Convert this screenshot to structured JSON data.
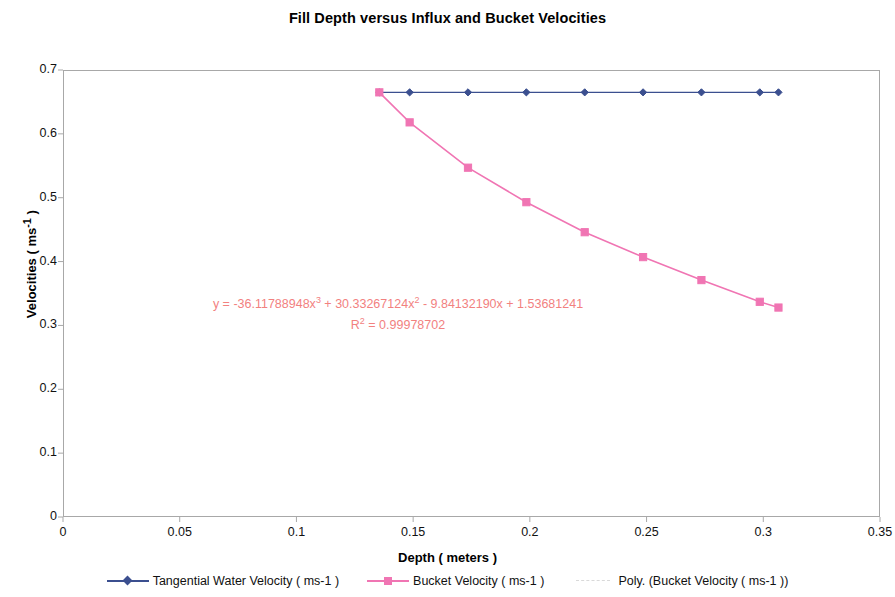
{
  "chart_data": {
    "type": "line",
    "title": "Fill Depth versus Influx and Bucket Velocities",
    "xlabel": "Depth ( meters )",
    "ylabel": "Velocities ( ms-1 )",
    "xlim": [
      0,
      0.35
    ],
    "ylim": [
      0,
      0.7
    ],
    "xticks": [
      "0",
      "0.05",
      "0.1",
      "0.15",
      "0.2",
      "0.25",
      "0.3",
      "0.35"
    ],
    "xtick_values": [
      0,
      0.05,
      0.1,
      0.15,
      0.2,
      0.25,
      0.3,
      0.35
    ],
    "yticks": [
      "0",
      "0.1",
      "0.2",
      "0.3",
      "0.4",
      "0.5",
      "0.6",
      "0.7"
    ],
    "ytick_values": [
      0,
      0.1,
      0.2,
      0.3,
      0.4,
      0.5,
      0.6,
      0.7
    ],
    "grid": false,
    "legend_position": "bottom",
    "series": [
      {
        "name": "Tangential Water Velocity ( ms-1 )",
        "color": "#3b4f8f",
        "marker": "diamond",
        "x": [
          0.1355,
          0.1485,
          0.1735,
          0.1985,
          0.2235,
          0.2485,
          0.2735,
          0.2985,
          0.3065
        ],
        "values": [
          0.665,
          0.665,
          0.665,
          0.665,
          0.665,
          0.665,
          0.665,
          0.665,
          0.665
        ]
      },
      {
        "name": "Bucket Velocity ( ms-1 )",
        "color": "#f075b3",
        "marker": "square",
        "x": [
          0.1355,
          0.1485,
          0.1735,
          0.1985,
          0.2235,
          0.2485,
          0.2735,
          0.2985,
          0.3065
        ],
        "values": [
          0.665,
          0.618,
          0.547,
          0.493,
          0.446,
          0.407,
          0.371,
          0.337,
          0.328
        ]
      },
      {
        "name": "Poly. (Bucket Velocity ( ms-1 ))",
        "color": "#d9d9d9",
        "marker": "none",
        "x": [],
        "values": []
      }
    ],
    "annotations": [
      {
        "text_line1": "y = -36.11788948x3 + 30.33267124x2 - 9.84132190x + 1.53681241",
        "text_line2": "R2 = 0.99978702",
        "color": "#f2817f"
      }
    ],
    "equation": {
      "prefix": "y = -36.11788948x",
      "exp1": "3",
      "mid1": " + 30.33267124x",
      "exp2": "2",
      "mid2": " - 9.84132190x + 1.53681241",
      "r_prefix": "R",
      "r_exp": "2",
      "r_value": " = 0.99978702"
    }
  },
  "legend": {
    "items": [
      {
        "label": "Tangential Water Velocity ( ms-1 )",
        "color": "#3b4f8f",
        "marker": "diamond"
      },
      {
        "label": "Bucket Velocity ( ms-1 )",
        "color": "#f075b3",
        "marker": "square"
      },
      {
        "label": "Poly. (Bucket Velocity ( ms-1 ))",
        "color": "#d9d9d9",
        "marker": "dashed"
      }
    ]
  },
  "axis_y_label_parts": {
    "main": "Velocities ( ms",
    "sup": "-1",
    "tail": " )"
  }
}
